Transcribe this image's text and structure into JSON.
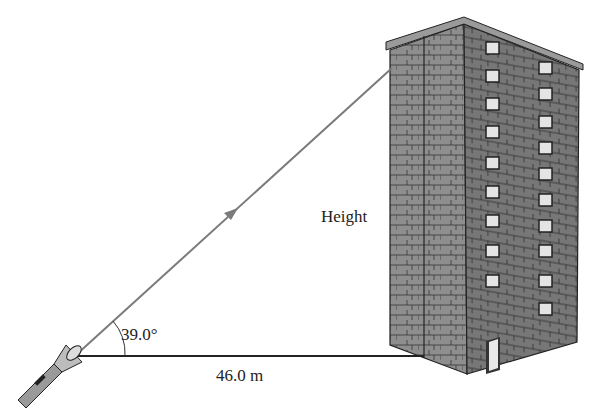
{
  "labels": {
    "angle": "39.0°",
    "distance": "46.0 m",
    "height": "Height"
  },
  "figure": {
    "angle_deg": 39.0,
    "distance_m": 46.0,
    "unknown": "Height",
    "objects": [
      "flashlight",
      "light-ray",
      "ground-line",
      "building"
    ]
  },
  "colors": {
    "ray": "#7a7a7a",
    "ground": "#222222",
    "brick_dark": "#6f6f6f",
    "brick_light": "#9a9a9a",
    "window": "#e4e4e4"
  }
}
